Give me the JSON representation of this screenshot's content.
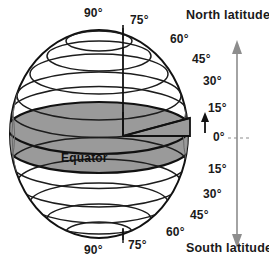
{
  "diagram": {
    "colors": {
      "band_fill": "#9a9a9a",
      "outline": "#111111",
      "grid_line": "#2a2a2a",
      "arrow": "#8d8d8d",
      "background": "#ffffff",
      "text": "#161616"
    },
    "equator_label": "Equator",
    "hemispheres": {
      "north_label": "North latitude",
      "south_label": "South latitude"
    },
    "north_degree_labels": [
      "90°",
      "75°",
      "60°",
      "45°",
      "30°",
      "15°",
      "0°"
    ],
    "south_degree_labels": [
      "15°",
      "30°",
      "45°",
      "60°",
      "75°",
      "90°"
    ],
    "labels": {
      "n90": "90°",
      "n75": "75°",
      "n60": "60°",
      "n45": "45°",
      "n30": "30°",
      "n15": "15°",
      "zero": "0°",
      "s15": "15°",
      "s30": "30°",
      "s45": "45°",
      "s60": "60°",
      "s75": "75°",
      "s90": "90°"
    },
    "axis_arrow": {
      "name": "double-headed-latitude-arrow",
      "direction": "both"
    },
    "angle_wedge": {
      "name": "fifteen-degree-angle-wedge",
      "value": "15°"
    }
  }
}
